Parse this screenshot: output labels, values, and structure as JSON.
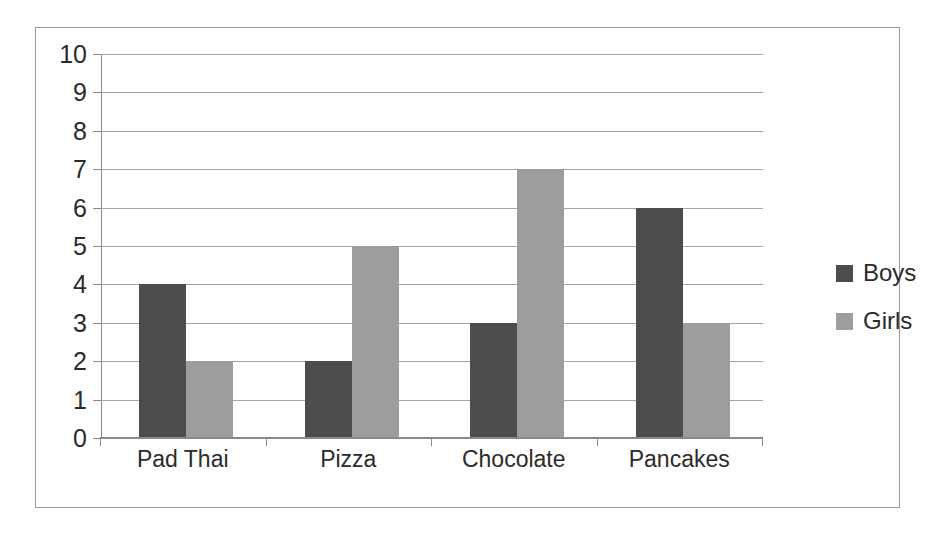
{
  "chart_data": {
    "type": "bar",
    "title": "",
    "subtitle": "",
    "xlabel": "",
    "ylabel": "",
    "categories": [
      "Pad Thai",
      "Pizza",
      "Chocolate",
      "Pancakes"
    ],
    "series": [
      {
        "name": "Boys",
        "values": [
          4,
          2,
          3,
          6
        ],
        "color": "#4d4d4d"
      },
      {
        "name": "Girls",
        "values": [
          2,
          5,
          7,
          3
        ],
        "color": "#9d9d9d"
      }
    ],
    "ylim": [
      0,
      10
    ],
    "ytick_labels": [
      "10",
      "9",
      "8",
      "7",
      "6",
      "5",
      "4",
      "3",
      "2",
      "1",
      "0"
    ],
    "ytick_values": [
      10,
      9,
      8,
      7,
      6,
      5,
      4,
      3,
      2,
      1,
      0
    ],
    "grid": true,
    "grid_axis": "y",
    "legend_position": "right",
    "legend_entries": [
      "Boys",
      "Girls"
    ]
  },
  "colors": {
    "boys": "#4d4d4d",
    "girls": "#9d9d9d",
    "gridline": "#a6a6a6",
    "axis": "#8a8a8a",
    "frame_border": "#9a9a9a",
    "text": "#2b2b2b",
    "background": "#ffffff"
  }
}
